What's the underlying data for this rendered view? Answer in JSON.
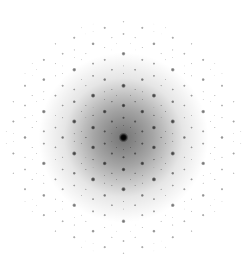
{
  "image": {
    "subject": "decagonal quasicrystal diffraction pattern",
    "symmetry": "10-fold",
    "background_color": "#ffffff",
    "spot_color": "#000000",
    "center": [
      123.5,
      137.5
    ],
    "first_ring_radius": 32,
    "halo_radius": 70,
    "extent_radius": 118
  }
}
